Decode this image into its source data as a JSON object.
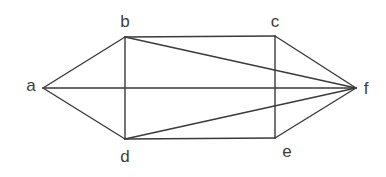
{
  "diagram": {
    "type": "graph",
    "stroke_color": "#3a3a3a",
    "label_color": "#3c3c3c",
    "vertices": [
      {
        "id": "a",
        "label": "a",
        "x": 43,
        "y": 88,
        "lx": 31,
        "ly": 91
      },
      {
        "id": "b",
        "label": "b",
        "x": 125,
        "y": 37,
        "lx": 125,
        "ly": 27
      },
      {
        "id": "c",
        "label": "c",
        "x": 275,
        "y": 36,
        "lx": 275,
        "ly": 27
      },
      {
        "id": "d",
        "label": "d",
        "x": 125,
        "y": 139,
        "lx": 125,
        "ly": 162
      },
      {
        "id": "e",
        "label": "e",
        "x": 275,
        "y": 138,
        "lx": 287,
        "ly": 157
      },
      {
        "id": "f",
        "label": "f",
        "x": 356,
        "y": 88,
        "lx": 366,
        "ly": 94
      }
    ],
    "edges": [
      [
        "a",
        "b"
      ],
      [
        "a",
        "d"
      ],
      [
        "a",
        "f"
      ],
      [
        "b",
        "c"
      ],
      [
        "b",
        "d"
      ],
      [
        "b",
        "f"
      ],
      [
        "c",
        "e"
      ],
      [
        "c",
        "f"
      ],
      [
        "d",
        "e"
      ],
      [
        "d",
        "f"
      ],
      [
        "e",
        "f"
      ]
    ]
  }
}
